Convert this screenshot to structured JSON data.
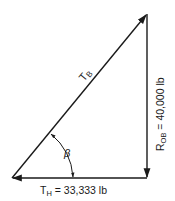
{
  "diagram": {
    "type": "force-triangle",
    "vectors": {
      "tb": {
        "label": "T",
        "subscript": "B"
      },
      "rob": {
        "label": "R",
        "subscript": "OB",
        "value_text": " = 40,000 lb"
      },
      "th": {
        "label": "T",
        "subscript": "H",
        "value_text": " = 33,333 lb"
      }
    },
    "angle": {
      "label": "β"
    },
    "colors": {
      "line": "#1a1a1a",
      "background": "#ffffff"
    }
  }
}
